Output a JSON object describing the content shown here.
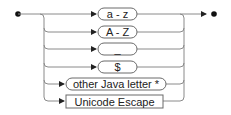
{
  "diagram": {
    "type": "railroad-syntax-diagram",
    "line_color": "#8a8a8a",
    "box_stroke": "#6a6a6a",
    "text_color": "#222222",
    "alternatives": [
      {
        "label": "a - z",
        "kind": "terminal"
      },
      {
        "label": "A - Z",
        "kind": "terminal"
      },
      {
        "label": "_",
        "kind": "terminal"
      },
      {
        "label": "$",
        "kind": "terminal"
      },
      {
        "label": "other Java letter *",
        "kind": "terminal"
      },
      {
        "label": "Unicode Escape",
        "kind": "nonterminal"
      }
    ],
    "start_marker": "start-dot",
    "end_marker": "end-arrow-dot"
  }
}
